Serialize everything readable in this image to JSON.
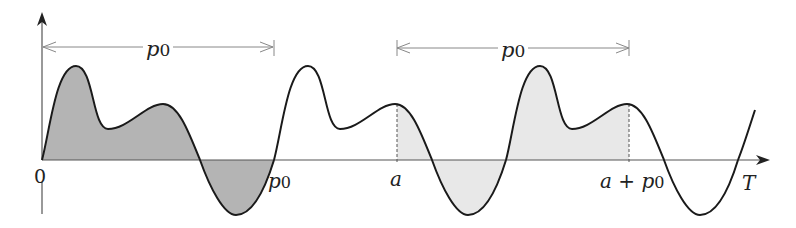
{
  "diagram": {
    "colors": {
      "curve": "#1a1a1a",
      "axis": "#555555",
      "dimension_line": "#888888",
      "shade_dark": "#b4b4b4",
      "shade_light": "#e8e8e8"
    },
    "axis": {
      "x_label": "T",
      "origin_label": "0"
    },
    "ticks": [
      {
        "id": "p0",
        "label": "p",
        "sub": "0"
      },
      {
        "id": "a",
        "label": "a"
      },
      {
        "id": "a_plus_p0",
        "label": "a + p",
        "sub": "0"
      }
    ],
    "dimensions": [
      {
        "id": "interval-0-p0",
        "label": "p",
        "sub": "0",
        "from": "0",
        "to": "p0"
      },
      {
        "id": "interval-a-a-plus-p0",
        "label": "p",
        "sub": "0",
        "from": "a",
        "to": "a + p0"
      }
    ],
    "shaded_regions": [
      {
        "id": "dark",
        "from": "0",
        "to": "p0",
        "shade": "dark"
      },
      {
        "id": "light",
        "from": "a",
        "to": "a + p0",
        "shade": "light"
      }
    ]
  }
}
